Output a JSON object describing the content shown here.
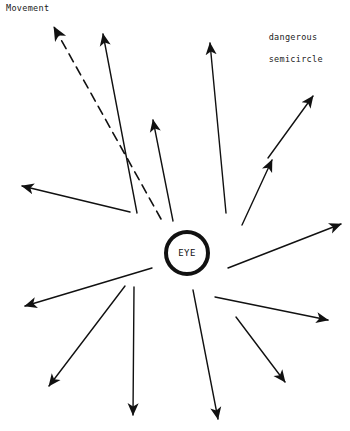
{
  "figure": {
    "width": 350,
    "height": 431,
    "background": "#ffffff",
    "stroke_color": "#111111"
  },
  "labels": {
    "movement": "Movement",
    "dangerous_semicircle_line1": "dangerous",
    "dangerous_semicircle_line2": "semicircle",
    "eye": "EYE"
  },
  "eye": {
    "label": "EYE",
    "center_x": 187,
    "center_y": 253,
    "radius": 21,
    "stroke_width": 4,
    "stroke_color": "#111111",
    "fill": "#ffffff"
  },
  "movement_arrow": {
    "name": "movement-direction-arrow",
    "style": "dashed",
    "dash_pattern": "9 6",
    "stroke_width": 1.6,
    "x1": 161,
    "y1": 219,
    "x2": 54,
    "y2": 27
  },
  "chart_data": {
    "type": "scatter",
    "xlabel": "",
    "ylabel": "",
    "xlim": [
      0,
      350
    ],
    "ylim": [
      431,
      0
    ],
    "grid": false,
    "legend_position": "none",
    "annotations": [
      {
        "text": "Movement",
        "x": 6,
        "y": 10
      },
      {
        "text": "dangerous semicircle",
        "x": 247,
        "y": 30
      },
      {
        "text": "EYE",
        "x": 187,
        "y": 253
      }
    ],
    "series": [
      {
        "name": "radial-wind-arrows",
        "type": "vector",
        "stroke_width": 1.4,
        "vectors": [
          {
            "id": 1,
            "label": "arrow-nnw",
            "x1": 137,
            "y1": 213,
            "x2": 103,
            "y2": 34,
            "bearing_deg": 349
          },
          {
            "id": 2,
            "label": "arrow-n-inner",
            "x1": 173,
            "y1": 221,
            "x2": 153,
            "y2": 120
          },
          {
            "id": 3,
            "label": "arrow-n",
            "x1": 226,
            "y1": 213,
            "x2": 210,
            "y2": 43,
            "bearing_deg": 5
          },
          {
            "id": 4,
            "label": "arrow-nne",
            "x1": 242,
            "y1": 225,
            "x2": 272,
            "y2": 160
          },
          {
            "id": 5,
            "label": "arrow-ne",
            "x1": 268,
            "y1": 158,
            "x2": 313,
            "y2": 96,
            "bearing_deg": 36
          },
          {
            "id": 6,
            "label": "arrow-ene",
            "x1": 228,
            "y1": 268,
            "x2": 341,
            "y2": 224,
            "bearing_deg": 69
          },
          {
            "id": 7,
            "label": "arrow-e",
            "x1": 215,
            "y1": 297,
            "x2": 328,
            "y2": 320,
            "bearing_deg": 101
          },
          {
            "id": 8,
            "label": "arrow-ese",
            "x1": 236,
            "y1": 317,
            "x2": 285,
            "y2": 382
          },
          {
            "id": 9,
            "label": "arrow-sse",
            "x1": 193,
            "y1": 290,
            "x2": 218,
            "y2": 419,
            "bearing_deg": 169
          },
          {
            "id": 10,
            "label": "arrow-s",
            "x1": 134,
            "y1": 287,
            "x2": 133,
            "y2": 415,
            "bearing_deg": 180
          },
          {
            "id": 11,
            "label": "arrow-ssw",
            "x1": 125,
            "y1": 286,
            "x2": 49,
            "y2": 386,
            "bearing_deg": 217
          },
          {
            "id": 12,
            "label": "arrow-sw",
            "x1": 152,
            "y1": 268,
            "x2": 25,
            "y2": 306,
            "bearing_deg": 253
          },
          {
            "id": 13,
            "label": "arrow-w",
            "x1": 130,
            "y1": 212,
            "x2": 22,
            "y2": 186,
            "bearing_deg": 283
          },
          {
            "id": 14,
            "label": "arrow-movement-dashed",
            "x1": 161,
            "y1": 219,
            "x2": 54,
            "y2": 27,
            "style": "dashed"
          }
        ]
      }
    ]
  }
}
